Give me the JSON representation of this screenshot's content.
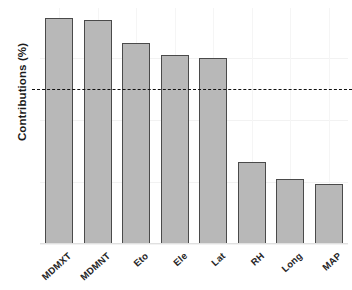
{
  "chart_data": {
    "type": "bar",
    "title": "",
    "xlabel": "",
    "ylabel": "Contributions (%)",
    "categories": [
      "MDMXT",
      "MDMNT",
      "Eto",
      "Ele",
      "Lat",
      "RH",
      "Long",
      "MAP"
    ],
    "values": [
      18.2,
      18.0,
      16.2,
      15.2,
      15.0,
      6.6,
      5.2,
      4.8
    ],
    "ylim": [
      0,
      19
    ],
    "yticks": [
      0,
      5,
      10,
      15
    ],
    "ytick_labels": [
      "0",
      "5",
      "10",
      "15"
    ],
    "grid": true,
    "legend": "none",
    "annotations": [
      {
        "type": "hline",
        "name": "threshold-line",
        "value": 12.5,
        "style": "dashed",
        "color": "#111111"
      }
    ],
    "bar_fill": "#b8b8b8",
    "bar_stroke": "#4a4a4a",
    "background": "#ffffff"
  },
  "axis": {
    "y_title": "Contributions (%)"
  }
}
